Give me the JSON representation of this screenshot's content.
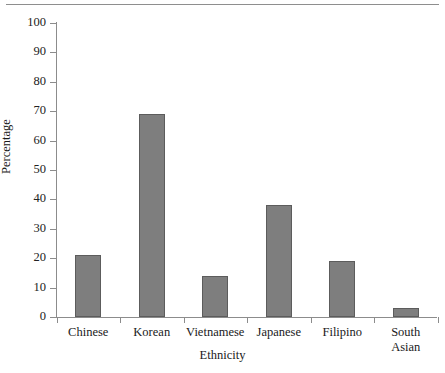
{
  "chart_data": {
    "type": "bar",
    "title": "",
    "subtitle": "",
    "xlabel": "Ethnicity",
    "ylabel": "Percentage",
    "categories": [
      "Chinese",
      "Korean",
      "Vietnamese",
      "Japanese",
      "Filipino",
      "South Asian"
    ],
    "values": [
      21,
      69,
      14,
      38,
      19,
      3
    ],
    "series": [
      {
        "name": "Percentage",
        "values": [
          21,
          69,
          14,
          38,
          19,
          3
        ]
      }
    ],
    "ylim": [
      0,
      100
    ],
    "yticks": [
      0,
      10,
      20,
      30,
      40,
      50,
      60,
      70,
      80,
      90,
      100
    ],
    "ytick_labels": [
      "0",
      "10",
      "20",
      "30",
      "40",
      "50",
      "60",
      "70",
      "80",
      "90",
      "100"
    ],
    "grid": false,
    "legend": false,
    "legend_position": "none",
    "bar_color": "#7e7e7e",
    "bar_edge_color": "#5c5c5c",
    "axis_color": "#8c8c8c",
    "background": "#ffffff",
    "annotations": []
  },
  "figure": {
    "top_rule": true
  }
}
